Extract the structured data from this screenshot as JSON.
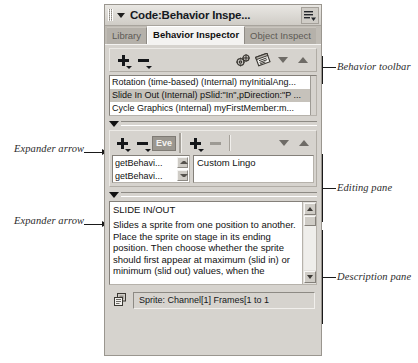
{
  "window": {
    "title": "Code:Behavior Inspe...",
    "collapse_icon": "triangle-down-icon",
    "gripper_icon": "drag-gripper-icon",
    "panel_menu_icon": "panel-menu-icon"
  },
  "tabs": [
    {
      "label": "Library",
      "active": false
    },
    {
      "label": "Behavior Inspector",
      "active": true
    },
    {
      "label": "Object Inspect",
      "active": false
    }
  ],
  "behavior_toolbar": {
    "buttons": [
      {
        "name": "add-behavior-button",
        "icon": "plus-dropdown-icon"
      },
      {
        "name": "remove-behavior-button",
        "icon": "minus-dropdown-icon"
      },
      {
        "name": "behavior-settings-button",
        "icon": "gears-icon"
      },
      {
        "name": "script-button",
        "icon": "script-window-icon"
      },
      {
        "name": "move-down-button",
        "icon": "triangle-down-icon"
      },
      {
        "name": "move-up-button",
        "icon": "triangle-up-icon"
      }
    ]
  },
  "behavior_list": {
    "rows": [
      {
        "text": "Rotation (time-based) (Internal) myInitialAng...",
        "selected": false
      },
      {
        "text": "Slide In Out (Internal) pSlid:\"In\",pDirection:\"P ...",
        "selected": true
      },
      {
        "text": "Cycle Graphics (Internal) myFirstMember:m...",
        "selected": false
      }
    ]
  },
  "expanders": [
    {
      "label": "Expander arrow",
      "icon": "triangle-down-icon"
    },
    {
      "label": "Expander arrow",
      "icon": "triangle-down-icon"
    }
  ],
  "editing_pane": {
    "toolbar": {
      "add_event_icon": "plus-dropdown-icon",
      "remove_event_icon": "minus-dropdown-icon",
      "events_button_label": "Eve",
      "add_action_icon": "plus-dropdown-icon",
      "remove_action_icon": "minus-icon",
      "move_down_icon": "triangle-down-icon",
      "move_up_icon": "triangle-up-icon"
    },
    "event_list": [
      {
        "text": "getBehavi...",
        "spinner": "scroll-up-icon"
      },
      {
        "text": "getBehavi...",
        "spinner": "scroll-down-icon"
      }
    ],
    "action_value": "Custom Lingo"
  },
  "description_pane": {
    "title": "SLIDE IN/OUT",
    "body": "Slides a sprite from one position to another. Place the sprite on stage in its ending position. Then choose whether the sprite should first appear at maximum (slid in) or minimum (slid out) values, when the",
    "scroll_up_icon": "scroll-up-icon",
    "scroll_down_icon": "scroll-down-icon"
  },
  "status_bar": {
    "icon": "sprite-layers-icon",
    "text": "Sprite: Channel[1] Frames[1 to 1"
  },
  "annotations": [
    {
      "name": "behavior-toolbar",
      "label": "Behavior toolbar"
    },
    {
      "name": "editing-pane",
      "label": "Editing pane"
    },
    {
      "name": "description-pane",
      "label": "Description pane"
    },
    {
      "name": "expander-arrow-top",
      "label": "Expander arrow"
    },
    {
      "name": "expander-arrow-bottom",
      "label": "Expander arrow"
    }
  ],
  "colors": {
    "window_face": "#d6d3ce",
    "selection": "#c6c2bb",
    "field_white": "#ffffff",
    "text": "#111111"
  }
}
